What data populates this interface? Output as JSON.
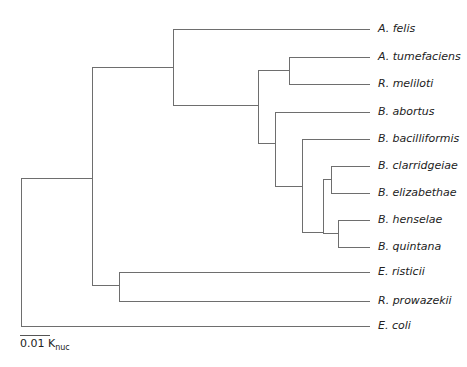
{
  "tree": {
    "leaf_x": 370,
    "leaves": [
      {
        "name": "A. felis",
        "y": 29
      },
      {
        "name": "A. tumefaciens",
        "y": 57
      },
      {
        "name": "R. meliloti",
        "y": 84
      },
      {
        "name": "B. abortus",
        "y": 112
      },
      {
        "name": "B. bacilliformis",
        "y": 139
      },
      {
        "name": "B. clarridgeiae",
        "y": 166
      },
      {
        "name": "B. elizabethae",
        "y": 193
      },
      {
        "name": "B. henselae",
        "y": 220
      },
      {
        "name": "B. quintana",
        "y": 247
      },
      {
        "name": "E. risticii",
        "y": 272
      },
      {
        "name": "R. prowazekii",
        "y": 301
      },
      {
        "name": "E. coli",
        "y": 326
      }
    ],
    "newick": "((A. felis,((A. tumefaciens,R. meliloti),(B. abortus,(B. bacilliformis,((B. clarridgeiae,B. elizabethae),(B. henselae,B. quintana)))))),(E. risticii,R. prowazekii)),E. coli"
  },
  "scale_bar": {
    "value": "0.01 K",
    "subscript": "nuc"
  }
}
